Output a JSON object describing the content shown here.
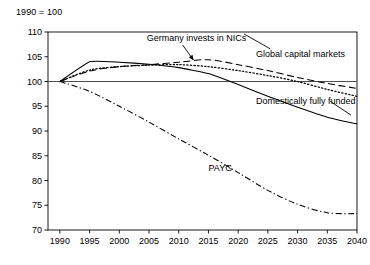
{
  "figure": {
    "index_note": "1990 = 100"
  },
  "chart_data": {
    "type": "line",
    "title": "",
    "subtitle": "",
    "xlabel": "",
    "ylabel": "",
    "index_note": "1990 = 100",
    "xlim": [
      1988,
      2040
    ],
    "ylim": [
      70,
      110
    ],
    "x_ticks": [
      1990,
      1995,
      2000,
      2005,
      2010,
      2015,
      2020,
      2025,
      2030,
      2035,
      2040
    ],
    "x_tick_labels": [
      "1990",
      "1995",
      "2000",
      "2005",
      "2010",
      "2015",
      "2020",
      "2025",
      "2030",
      "2035",
      "2040"
    ],
    "y_ticks": [
      70,
      75,
      80,
      85,
      90,
      95,
      100,
      105,
      110
    ],
    "y_tick_labels": [
      "70",
      "75",
      "80",
      "85",
      "90",
      "95",
      "100",
      "105",
      "110"
    ],
    "grid": false,
    "legend_position": "inline-annotations",
    "reference_line": {
      "y": 100,
      "style": "solid",
      "color": "#4d4d4d"
    },
    "x": [
      1990,
      1995,
      2000,
      2005,
      2010,
      2015,
      2020,
      2025,
      2030,
      2035,
      2040
    ],
    "series": [
      {
        "name": "Germany invests in NICs",
        "style": "dashed",
        "color": "#000000",
        "values": [
          100.0,
          102.1,
          103.0,
          103.4,
          103.9,
          104.4,
          103.4,
          102.2,
          100.8,
          99.6,
          98.6
        ]
      },
      {
        "name": "Global capital markets",
        "style": "dotted",
        "color": "#000000",
        "values": [
          100.0,
          102.3,
          103.0,
          103.3,
          103.4,
          103.0,
          102.2,
          101.2,
          100.0,
          98.4,
          97.0
        ]
      },
      {
        "name": "Domestically fully funded",
        "style": "solid",
        "color": "#000000",
        "values": [
          100.0,
          104.0,
          103.9,
          103.5,
          102.8,
          101.6,
          99.4,
          97.0,
          94.8,
          92.8,
          91.4
        ]
      },
      {
        "name": "PAYG",
        "style": "dash-dot",
        "color": "#000000",
        "values": [
          100.0,
          98.0,
          95.0,
          91.8,
          88.4,
          85.1,
          81.6,
          78.0,
          75.2,
          73.5,
          73.3
        ]
      }
    ],
    "annotations": [
      {
        "name": "Germany invests in NICs",
        "text": "Germany invests in NICs",
        "x": 2013,
        "y": 108.2,
        "has_arrow": true,
        "arrow_target": {
          "x": 2012.5,
          "y": 104.3
        }
      },
      {
        "name": "Global capital markets",
        "text": "Global capital markets",
        "x": 2023,
        "y": 105.0,
        "has_arrow": false
      },
      {
        "name": "Domestically fully funded",
        "text": "Domestically fully funded",
        "x": 2023,
        "y": 95.5,
        "has_arrow": false
      },
      {
        "name": "PAYG",
        "text": "PAYG",
        "x": 2017,
        "y": 82.0,
        "has_arrow": false
      }
    ]
  }
}
